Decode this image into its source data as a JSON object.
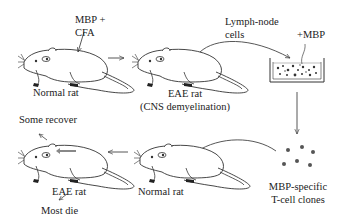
{
  "diagram": {
    "labels": {
      "injection": [
        "MBP +",
        "CFA"
      ],
      "rat1": "Normal rat",
      "rat2": [
        "EAE rat",
        "(CNS demyelination)"
      ],
      "lymph": [
        "Lymph-node",
        "cells"
      ],
      "add_mbp": "+MBP",
      "clones": [
        "MBP-specific",
        "T-cell clones"
      ],
      "rat3": "Normal rat",
      "rat4": "EAE rat",
      "some_recover": "Some recover",
      "most_die": "Most die"
    },
    "nodes": [
      {
        "id": "rat1",
        "type": "rat",
        "label": "Normal rat"
      },
      {
        "id": "rat2",
        "type": "rat",
        "label": "EAE rat (CNS demyelination)"
      },
      {
        "id": "dish",
        "type": "culture-dish",
        "label": "+MBP"
      },
      {
        "id": "clones",
        "type": "cell-cluster",
        "label": "MBP-specific T-cell clones"
      },
      {
        "id": "rat3",
        "type": "rat",
        "label": "Normal rat"
      },
      {
        "id": "rat4",
        "type": "rat",
        "label": "EAE rat"
      }
    ],
    "edges": [
      {
        "from": "rat1",
        "to": "rat2"
      },
      {
        "from": "rat2",
        "to": "dish",
        "label": "Lymph-node cells"
      },
      {
        "from": "dish",
        "to": "clones"
      },
      {
        "from": "clones",
        "to": "rat3"
      },
      {
        "from": "rat3",
        "to": "rat4"
      },
      {
        "from": "rat4",
        "to": "outcome-recover",
        "label": "Some recover"
      },
      {
        "from": "rat4",
        "to": "outcome-die",
        "label": "Most die"
      }
    ],
    "colors": {
      "line": "#333333",
      "dot": "#444444",
      "dot_light": "#888888"
    }
  }
}
